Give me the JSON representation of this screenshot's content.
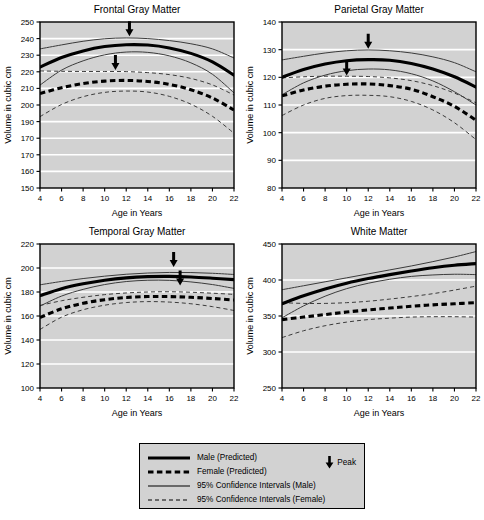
{
  "figure": {
    "axis_y_label": "Volume in cubic cm",
    "axis_x_label": "Age in Years"
  },
  "legend": {
    "items": [
      {
        "label": "Male (Predicted)",
        "style": "solid-thick"
      },
      {
        "label": "Female (Predicted)",
        "style": "dashed-thick"
      },
      {
        "label": "95% Confidence Intervals (Male)",
        "style": "solid-thin"
      },
      {
        "label": "95% Confidence Intervals (Female)",
        "style": "dashed-thin"
      }
    ],
    "peak_label": "Peak",
    "peak_icon": "down-arrow-icon",
    "background_color": "#d2d2d2",
    "border_color": "#000000"
  },
  "chart_data": [
    {
      "type": "line",
      "title": "Frontal Gray Matter",
      "xlabel": "Age in Years",
      "ylabel": "Volume in cubic cm",
      "xlim": [
        4,
        22
      ],
      "ylim": [
        150,
        250
      ],
      "xticks": [
        4,
        6,
        8,
        10,
        12,
        14,
        16,
        18,
        20,
        22
      ],
      "yticks": [
        150,
        160,
        170,
        170,
        190,
        200,
        210,
        220,
        230,
        240,
        250
      ],
      "ytick_values": [
        150,
        160,
        170,
        180,
        190,
        200,
        210,
        220,
        230,
        240,
        250
      ],
      "grid": "horizontal",
      "legend_position": "figure-bottom",
      "x": [
        4,
        6,
        8,
        10,
        12,
        14,
        16,
        18,
        20,
        22
      ],
      "series": [
        {
          "name": "Male (Predicted)",
          "style": "solid-thick",
          "values": [
            222.8,
            228.6,
            232.6,
            235.2,
            236.3,
            236.1,
            234.4,
            231.1,
            226.0,
            218.0
          ]
        },
        {
          "name": "95% CI Upper (Male)",
          "style": "solid-thin",
          "values": [
            233.8,
            236.2,
            238.4,
            239.9,
            240.4,
            240.0,
            238.8,
            236.9,
            233.8,
            228.3
          ]
        },
        {
          "name": "95% CI Lower (Male)",
          "style": "solid-thin",
          "values": [
            212.0,
            221.0,
            226.6,
            230.2,
            231.9,
            231.7,
            229.6,
            225.4,
            218.5,
            207.3
          ]
        },
        {
          "name": "Female (Predicted)",
          "style": "dashed-thick",
          "values": [
            206.9,
            210.4,
            212.9,
            214.4,
            214.8,
            214.2,
            212.4,
            209.2,
            204.2,
            197.0
          ]
        },
        {
          "name": "95% CI Upper (Female)",
          "style": "dashed-thin",
          "values": [
            220.5,
            220.3,
            220.2,
            220.2,
            220.1,
            219.5,
            218.3,
            216.0,
            212.1,
            206.0
          ]
        },
        {
          "name": "95% CI Lower (Female)",
          "style": "dashed-thin",
          "values": [
            193.0,
            200.3,
            205.0,
            207.6,
            208.4,
            207.8,
            205.2,
            200.5,
            193.2,
            183.0
          ]
        }
      ],
      "annotations": [
        {
          "name": "peak-male",
          "label": "Peak",
          "x": 12.3,
          "y": 240.8,
          "group": "Male"
        },
        {
          "name": "peak-female",
          "label": "Peak",
          "x": 11.0,
          "y": 220.5,
          "group": "Female"
        }
      ]
    },
    {
      "type": "line",
      "title": "Parietal Gray Matter",
      "xlabel": "Age in Years",
      "ylabel": "Volume in cubic cm",
      "xlim": [
        4,
        22
      ],
      "ylim": [
        80,
        140
      ],
      "xticks": [
        4,
        6,
        8,
        10,
        12,
        14,
        16,
        18,
        20,
        22
      ],
      "yticks": [
        80,
        90,
        100,
        110,
        120,
        130,
        140
      ],
      "ytick_values": [
        80,
        90,
        100,
        110,
        120,
        130,
        140
      ],
      "grid": "horizontal",
      "legend_position": "figure-bottom",
      "x": [
        4,
        6,
        8,
        10,
        12,
        14,
        16,
        18,
        20,
        22
      ],
      "series": [
        {
          "name": "Male (Predicted)",
          "style": "solid-thick",
          "values": [
            120.0,
            122.8,
            124.8,
            126.0,
            126.4,
            126.2,
            125.0,
            123.0,
            120.2,
            116.5
          ]
        },
        {
          "name": "95% CI Upper (Male)",
          "style": "solid-thin",
          "values": [
            126.3,
            127.6,
            128.8,
            129.6,
            129.9,
            129.6,
            128.8,
            127.4,
            125.3,
            122.0
          ]
        },
        {
          "name": "95% CI Lower (Male)",
          "style": "solid-thin",
          "values": [
            113.7,
            118.0,
            120.8,
            122.4,
            123.0,
            122.7,
            121.3,
            118.7,
            114.8,
            110.0
          ]
        },
        {
          "name": "Female (Predicted)",
          "style": "dashed-thick",
          "values": [
            113.3,
            115.4,
            116.8,
            117.5,
            117.6,
            117.0,
            115.7,
            113.0,
            109.5,
            104.5
          ]
        },
        {
          "name": "95% CI Upper (Female)",
          "style": "dashed-thin",
          "values": [
            119.8,
            120.2,
            120.4,
            120.4,
            120.3,
            119.8,
            118.8,
            117.0,
            114.3,
            110.8
          ]
        },
        {
          "name": "95% CI Lower (Female)",
          "style": "dashed-thin",
          "values": [
            106.2,
            110.0,
            112.4,
            113.4,
            113.5,
            113.0,
            111.3,
            108.2,
            103.6,
            97.5
          ]
        }
      ],
      "annotations": [
        {
          "name": "peak-male",
          "label": "Peak",
          "x": 12.0,
          "y": 130.0,
          "group": "Male"
        },
        {
          "name": "peak-female",
          "label": "Peak",
          "x": 10.0,
          "y": 120.3,
          "group": "Female"
        }
      ]
    },
    {
      "type": "line",
      "title": "Temporal Gray Matter",
      "xlabel": "Age in Years",
      "ylabel": "Volume in cubic cm",
      "xlim": [
        4,
        22
      ],
      "ylim": [
        100,
        220
      ],
      "xticks": [
        4,
        6,
        8,
        10,
        12,
        14,
        16,
        18,
        20,
        22
      ],
      "yticks": [
        100,
        120,
        140,
        160,
        180,
        200,
        220
      ],
      "ytick_values": [
        100,
        120,
        140,
        160,
        180,
        200,
        220
      ],
      "grid": "horizontal",
      "legend_position": "figure-bottom",
      "x": [
        4,
        6,
        8,
        10,
        12,
        14,
        16,
        18,
        20,
        22
      ],
      "series": [
        {
          "name": "Male (Predicted)",
          "style": "solid-thick",
          "values": [
            177.0,
            182.8,
            186.8,
            189.8,
            191.8,
            192.8,
            193.0,
            192.5,
            191.5,
            190.3
          ]
        },
        {
          "name": "95% CI Upper (Male)",
          "style": "solid-thin",
          "values": [
            186.0,
            188.8,
            191.2,
            193.2,
            194.8,
            195.8,
            196.3,
            196.2,
            195.6,
            194.6
          ]
        },
        {
          "name": "95% CI Lower (Male)",
          "style": "solid-thin",
          "values": [
            168.3,
            176.6,
            182.2,
            186.2,
            188.7,
            189.8,
            189.7,
            188.4,
            186.2,
            183.0
          ]
        },
        {
          "name": "Female (Predicted)",
          "style": "dashed-thick",
          "values": [
            158.8,
            166.0,
            170.6,
            173.6,
            175.4,
            176.2,
            176.2,
            175.6,
            174.6,
            173.3
          ]
        },
        {
          "name": "95% CI Upper (Female)",
          "style": "dashed-thin",
          "values": [
            168.8,
            172.7,
            175.6,
            177.8,
            179.2,
            180.0,
            180.2,
            179.8,
            179.0,
            178.0
          ]
        },
        {
          "name": "95% CI Lower (Female)",
          "style": "dashed-thin",
          "values": [
            148.8,
            159.0,
            165.2,
            169.0,
            171.2,
            172.0,
            171.6,
            170.2,
            167.8,
            164.6
          ]
        }
      ],
      "annotations": [
        {
          "name": "peak-male",
          "label": "Peak",
          "x": 16.4,
          "y": 200.0,
          "group": "Male"
        },
        {
          "name": "peak-female",
          "label": "Peak",
          "x": 17.0,
          "y": 184.5,
          "group": "Female"
        }
      ]
    },
    {
      "type": "line",
      "title": "White Matter",
      "xlabel": "Age in Years",
      "ylabel": "Volume in cubic cm",
      "xlim": [
        4,
        22
      ],
      "ylim": [
        250,
        450
      ],
      "xticks": [
        4,
        6,
        8,
        10,
        12,
        14,
        16,
        18,
        20,
        22
      ],
      "yticks": [
        250,
        300,
        350,
        400,
        450
      ],
      "ytick_values": [
        250,
        300,
        350,
        400,
        450
      ],
      "grid": "horizontal",
      "legend_position": "figure-bottom",
      "x": [
        4,
        6,
        8,
        10,
        12,
        14,
        16,
        18,
        20,
        22
      ],
      "series": [
        {
          "name": "Male (Predicted)",
          "style": "solid-thick",
          "values": [
            367.0,
            378.0,
            387.5,
            395.5,
            402.0,
            407.5,
            412.5,
            417.0,
            420.5,
            422.8
          ]
        },
        {
          "name": "95% CI Upper (Male)",
          "style": "solid-thin",
          "values": [
            386.5,
            392.0,
            397.5,
            403.0,
            408.5,
            414.0,
            419.5,
            425.5,
            432.0,
            439.5
          ]
        },
        {
          "name": "95% CI Lower (Male)",
          "style": "solid-thin",
          "values": [
            347.5,
            364.0,
            377.5,
            388.0,
            395.5,
            401.0,
            405.0,
            407.0,
            408.0,
            407.5
          ]
        },
        {
          "name": "Female (Predicted)",
          "style": "dashed-thick",
          "values": [
            345.0,
            348.5,
            352.0,
            355.5,
            358.5,
            361.0,
            363.5,
            365.5,
            367.0,
            368.5
          ]
        },
        {
          "name": "95% CI Upper (Female)",
          "style": "dashed-thin",
          "values": [
            368.5,
            367.5,
            367.5,
            368.5,
            370.5,
            373.5,
            377.0,
            381.0,
            386.0,
            391.5
          ]
        },
        {
          "name": "95% CI Lower (Female)",
          "style": "dashed-thin",
          "values": [
            320.0,
            329.5,
            336.5,
            341.5,
            345.0,
            347.0,
            348.5,
            349.0,
            349.0,
            348.5
          ]
        }
      ],
      "annotations": []
    }
  ]
}
